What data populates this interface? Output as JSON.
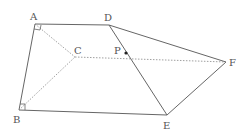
{
  "diagram": {
    "type": "geometry-figure",
    "points": {
      "A": {
        "label": "A",
        "x": 35,
        "y": 24,
        "lx": 30,
        "ly": 20
      },
      "B": {
        "label": "B",
        "x": 19,
        "y": 110,
        "lx": 13,
        "ly": 123
      },
      "C": {
        "label": "C",
        "x": 75,
        "y": 57,
        "lx": 74,
        "ly": 54
      },
      "D": {
        "label": "D",
        "x": 109,
        "y": 25,
        "lx": 104,
        "ly": 21
      },
      "E": {
        "label": "E",
        "x": 167,
        "y": 115,
        "lx": 163,
        "ly": 129
      },
      "F": {
        "label": "F",
        "x": 226,
        "y": 62,
        "lx": 229,
        "ly": 66
      },
      "P": {
        "label": "P",
        "x": 126,
        "y": 53,
        "lx": 114,
        "ly": 54
      }
    },
    "solid_segments": [
      "AD",
      "AB",
      "BE",
      "DF",
      "DE",
      "EF"
    ],
    "dashed_segments": [
      "AC",
      "BC",
      "CF"
    ],
    "right_angles": [
      "A",
      "B"
    ],
    "marked_point": "P",
    "colors": {
      "line": "#666666",
      "dashed": "#888888",
      "label": "#555555",
      "point": "#222222"
    }
  }
}
